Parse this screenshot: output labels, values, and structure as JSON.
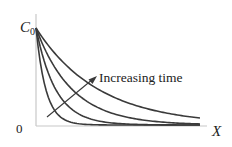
{
  "chart_data": {
    "type": "line",
    "title": "",
    "xlabel": "X",
    "ylabel": "C0",
    "y_tick_labels": [
      "0",
      "C0"
    ],
    "annotation": {
      "text": "Increasing time",
      "arrow": "diagonal arrow crossing curves toward later times"
    },
    "grid": false,
    "legend": "none",
    "series": [
      {
        "name": "t1",
        "description": "earliest time, steepest decay",
        "decay_length": 0.06
      },
      {
        "name": "t2",
        "decay_length": 0.12
      },
      {
        "name": "t3",
        "decay_length": 0.22
      },
      {
        "name": "t4",
        "description": "latest time, slowest decay",
        "decay_length": 0.38
      }
    ],
    "x_range": [
      0,
      1
    ],
    "y_range": [
      0,
      1
    ],
    "y0_value": 1
  },
  "labels": {
    "c0_main": "C",
    "c0_sub": "0",
    "zero": "0",
    "x_axis": "X",
    "annotation": "Increasing time"
  },
  "colors": {
    "axes": "#c8c8c8",
    "curves": "#3a3a3a",
    "text": "#222222"
  }
}
